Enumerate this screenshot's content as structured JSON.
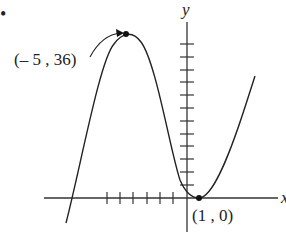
{
  "problem_marker": "•",
  "axes": {
    "x_label": "x",
    "y_label": "y",
    "x_ticks_left_count": 6,
    "y_ticks_up_count": 12
  },
  "points": {
    "max": {
      "label": "(– 5 , 36)",
      "x": -5,
      "y": 36
    },
    "min": {
      "label": "(1 , 0)",
      "x": 1,
      "y": 0
    }
  },
  "curve": {
    "description": "cubic with local maximum at (-5, 36) and local minimum at (1, 0)",
    "color": "#222222"
  }
}
